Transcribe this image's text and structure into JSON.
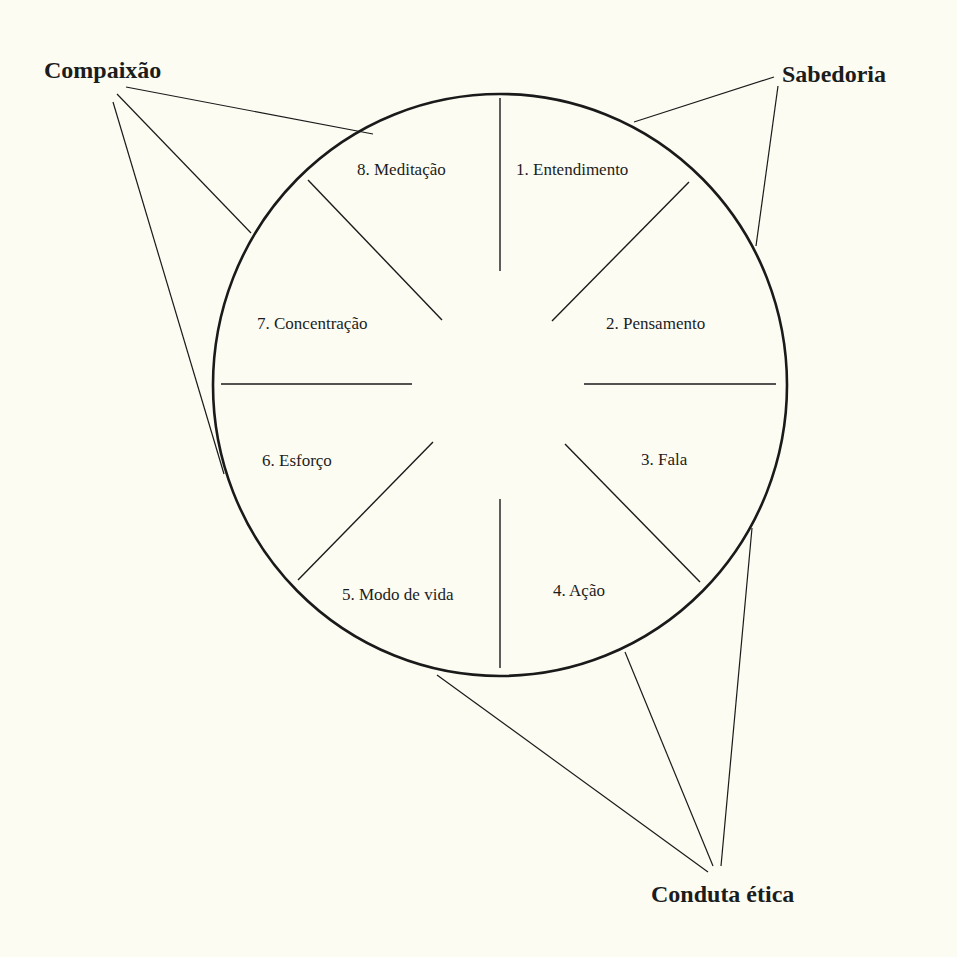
{
  "diagram": {
    "colors": {
      "background": "#fcfcf3",
      "ink": "#1a1a1a"
    },
    "segments": [
      {
        "id": 1,
        "label": "1. Entendimento"
      },
      {
        "id": 2,
        "label": "2. Pensamento"
      },
      {
        "id": 3,
        "label": "3. Fala"
      },
      {
        "id": 4,
        "label": "4. Ação"
      },
      {
        "id": 5,
        "label": "5. Modo de vida"
      },
      {
        "id": 6,
        "label": "6. Esforço"
      },
      {
        "id": 7,
        "label": "7. Concentração"
      },
      {
        "id": 8,
        "label": "8. Meditação"
      }
    ],
    "groups": {
      "compassion": {
        "label": "Compaixão",
        "segments": [
          6,
          7,
          8
        ]
      },
      "wisdom": {
        "label": "Sabedoria",
        "segments": [
          1,
          2
        ]
      },
      "ethics": {
        "label": "Conduta ética",
        "segments": [
          3,
          4,
          5
        ]
      }
    }
  }
}
